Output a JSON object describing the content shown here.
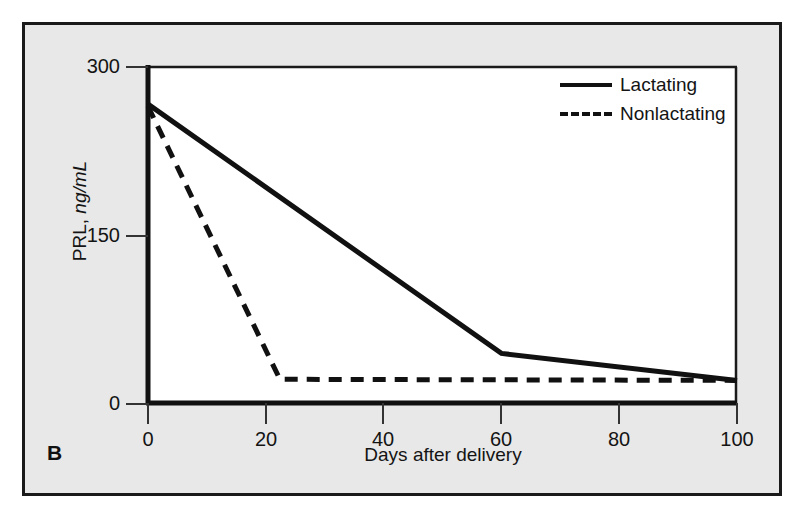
{
  "figure": {
    "panel_letter": "B",
    "background_color": "#e8e8e8",
    "plot_background_color": "#ffffff",
    "frame_color": "#1a1a1a",
    "line_color": "#111111"
  },
  "chart_data": {
    "type": "line",
    "title": "",
    "xlabel": "Days after delivery",
    "ylabel": "PRL, ng/mL",
    "ylabel_plain": "PRL,",
    "ylabel_unit": "ng/mL",
    "xlim": [
      0,
      100
    ],
    "ylim": [
      0,
      300
    ],
    "xticks": [
      0,
      20,
      40,
      60,
      80,
      100
    ],
    "xticklabels": [
      "0",
      "20",
      "40",
      "60",
      "80",
      "100"
    ],
    "yticks": [
      0,
      150,
      300
    ],
    "yticklabels": [
      "0",
      "150",
      "300"
    ],
    "grid": false,
    "legend_position": "top-right",
    "series": [
      {
        "name": "Lactating",
        "style": "solid",
        "x": [
          0,
          60,
          100
        ],
        "values": [
          267,
          45,
          21
        ]
      },
      {
        "name": "Nonlactating",
        "style": "dashed",
        "x": [
          0,
          22.4,
          100
        ],
        "values": [
          265,
          22,
          21
        ]
      }
    ]
  },
  "legend": {
    "items": [
      {
        "label": "Lactating",
        "style": "solid"
      },
      {
        "label": "Nonlactating",
        "style": "dashed"
      }
    ]
  },
  "axes": {
    "x_tick_labels": [
      "0",
      "20",
      "40",
      "60",
      "80",
      "100"
    ],
    "y_tick_labels": [
      "300",
      "150",
      "0"
    ],
    "x_title": "Days after delivery",
    "y_title_plain": "PRL, ",
    "y_title_unit": "ng/mL"
  }
}
